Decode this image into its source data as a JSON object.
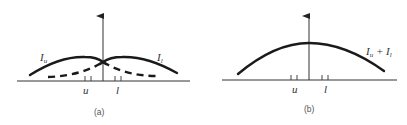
{
  "panels": [
    {
      "id": "a",
      "caption": "(a)",
      "labels": {
        "curve_upper_left": {
          "main": "I",
          "sub": "u"
        },
        "curve_upper_right": {
          "main": "I",
          "sub": "l"
        },
        "tick_u": "u",
        "tick_l": "l"
      }
    },
    {
      "id": "b",
      "caption": "(b)",
      "labels": {
        "sum_main1": "I",
        "sum_sub1": "u",
        "sum_plus": " + ",
        "sum_main2": "I",
        "sum_sub2": "l",
        "tick_u": "u",
        "tick_l": "l"
      }
    }
  ]
}
